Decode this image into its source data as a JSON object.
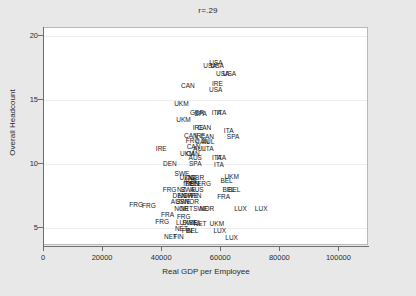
{
  "chart_data": {
    "type": "scatter",
    "title": "r=.29",
    "xlabel": "Real GDP per Employee",
    "ylabel": "Overall Headcount",
    "xlim": [
      0,
      110000
    ],
    "ylim": [
      3.6,
      20.6
    ],
    "xticks": [
      0,
      20000,
      40000,
      60000,
      80000,
      100000
    ],
    "xtick_labels": [
      "0",
      "20000",
      "40000",
      "60000",
      "80000",
      "100000"
    ],
    "yticks": [
      5,
      10,
      15,
      20
    ],
    "ytick_labels": [
      "5",
      "10",
      "15",
      "20"
    ],
    "grid": "horizontal",
    "legend": "none",
    "marker_style": "text-label",
    "points": [
      {
        "label": "USA",
        "x": 58200,
        "y": 17.9
      },
      {
        "label": "USA",
        "x": 56200,
        "y": 17.6
      },
      {
        "label": "USA",
        "x": 58600,
        "y": 17.6
      },
      {
        "label": "USA",
        "x": 60500,
        "y": 17.0
      },
      {
        "label": "USA",
        "x": 62800,
        "y": 17.0
      },
      {
        "label": "CAN",
        "x": 48700,
        "y": 16.1
      },
      {
        "label": "IRE",
        "x": 58700,
        "y": 16.2
      },
      {
        "label": "USA",
        "x": 58100,
        "y": 15.8
      },
      {
        "label": "UKM",
        "x": 46500,
        "y": 14.7
      },
      {
        "label": "GBR",
        "x": 51800,
        "y": 14.0
      },
      {
        "label": "SPA",
        "x": 53000,
        "y": 13.9
      },
      {
        "label": "ITA",
        "x": 58400,
        "y": 14.0
      },
      {
        "label": "ITA",
        "x": 60100,
        "y": 14.0
      },
      {
        "label": "UKM",
        "x": 47200,
        "y": 13.4
      },
      {
        "label": "IRE",
        "x": 52200,
        "y": 12.8
      },
      {
        "label": "CAN",
        "x": 54300,
        "y": 12.8
      },
      {
        "label": "ITA",
        "x": 62500,
        "y": 12.6
      },
      {
        "label": "CAN",
        "x": 49700,
        "y": 12.2
      },
      {
        "label": "IRE",
        "x": 52800,
        "y": 12.2
      },
      {
        "label": "CAN",
        "x": 55200,
        "y": 12.1
      },
      {
        "label": "SPA",
        "x": 64000,
        "y": 12.1
      },
      {
        "label": "FRG",
        "x": 50300,
        "y": 11.8
      },
      {
        "label": "CAN",
        "x": 53500,
        "y": 11.7
      },
      {
        "label": "AUL",
        "x": 55500,
        "y": 11.7
      },
      {
        "label": "CAN",
        "x": 50600,
        "y": 11.3
      },
      {
        "label": "AUL",
        "x": 52600,
        "y": 11.2
      },
      {
        "label": "ITA",
        "x": 55800,
        "y": 11.2
      },
      {
        "label": "IRE",
        "x": 39700,
        "y": 11.2
      },
      {
        "label": "UKM",
        "x": 48500,
        "y": 10.8
      },
      {
        "label": "CAN",
        "x": 50400,
        "y": 10.8
      },
      {
        "label": "AUS",
        "x": 51200,
        "y": 10.5
      },
      {
        "label": "ITA",
        "x": 58500,
        "y": 10.5
      },
      {
        "label": "ITA",
        "x": 60000,
        "y": 10.5
      },
      {
        "label": "DEN",
        "x": 42600,
        "y": 10.0
      },
      {
        "label": "SPA",
        "x": 51200,
        "y": 10.0
      },
      {
        "label": "ITA",
        "x": 59200,
        "y": 9.9
      },
      {
        "label": "SWE",
        "x": 46700,
        "y": 9.2
      },
      {
        "label": "UKM",
        "x": 48300,
        "y": 8.9
      },
      {
        "label": "NZ",
        "x": 50000,
        "y": 8.9
      },
      {
        "label": "GBR",
        "x": 51800,
        "y": 8.9
      },
      {
        "label": "UKM",
        "x": 63500,
        "y": 9.0
      },
      {
        "label": "AUS",
        "x": 49500,
        "y": 8.7
      },
      {
        "label": "BEL",
        "x": 61800,
        "y": 8.7
      },
      {
        "label": "IRE",
        "x": 49000,
        "y": 8.4
      },
      {
        "label": "DEN",
        "x": 50200,
        "y": 8.4
      },
      {
        "label": "BEL",
        "x": 51300,
        "y": 8.4
      },
      {
        "label": "FRG",
        "x": 54200,
        "y": 8.4
      },
      {
        "label": "FRG",
        "x": 42500,
        "y": 8.0
      },
      {
        "label": "NZ",
        "x": 46500,
        "y": 8.0
      },
      {
        "label": "SWE",
        "x": 48800,
        "y": 8.0
      },
      {
        "label": "AUS",
        "x": 51800,
        "y": 8.0
      },
      {
        "label": "BEL",
        "x": 62500,
        "y": 8.0
      },
      {
        "label": "BEL",
        "x": 64400,
        "y": 8.0
      },
      {
        "label": "DEN",
        "x": 45800,
        "y": 7.5
      },
      {
        "label": "NOR",
        "x": 47800,
        "y": 7.5
      },
      {
        "label": "SWE",
        "x": 49600,
        "y": 7.5
      },
      {
        "label": "FIN",
        "x": 51500,
        "y": 7.5
      },
      {
        "label": "FRA",
        "x": 60800,
        "y": 7.4
      },
      {
        "label": "AUS",
        "x": 45200,
        "y": 7.0
      },
      {
        "label": "SWE",
        "x": 47200,
        "y": 7.0
      },
      {
        "label": "NOR",
        "x": 50000,
        "y": 7.0
      },
      {
        "label": "FRG",
        "x": 31200,
        "y": 6.8
      },
      {
        "label": "FRG",
        "x": 35500,
        "y": 6.7
      },
      {
        "label": "NOR",
        "x": 46500,
        "y": 6.5
      },
      {
        "label": "NET",
        "x": 48200,
        "y": 6.5
      },
      {
        "label": "SWE",
        "x": 53000,
        "y": 6.5
      },
      {
        "label": "NOR",
        "x": 55200,
        "y": 6.5
      },
      {
        "label": "LUX",
        "x": 66500,
        "y": 6.5
      },
      {
        "label": "LUX",
        "x": 73500,
        "y": 6.5
      },
      {
        "label": "FRA",
        "x": 41800,
        "y": 6.0
      },
      {
        "label": "FRG",
        "x": 47300,
        "y": 5.9
      },
      {
        "label": "FRG",
        "x": 40000,
        "y": 5.5
      },
      {
        "label": "LUX",
        "x": 46800,
        "y": 5.4
      },
      {
        "label": "SWE",
        "x": 49300,
        "y": 5.4
      },
      {
        "label": "BEL",
        "x": 51200,
        "y": 5.4
      },
      {
        "label": "NET",
        "x": 52800,
        "y": 5.3
      },
      {
        "label": "UKM",
        "x": 58500,
        "y": 5.3
      },
      {
        "label": "NET",
        "x": 46500,
        "y": 4.9
      },
      {
        "label": "FIN",
        "x": 48400,
        "y": 4.8
      },
      {
        "label": "BEL",
        "x": 50200,
        "y": 4.8
      },
      {
        "label": "LUX",
        "x": 59500,
        "y": 4.8
      },
      {
        "label": "NET",
        "x": 42800,
        "y": 4.3
      },
      {
        "label": "FIN",
        "x": 45500,
        "y": 4.3
      },
      {
        "label": "LUX",
        "x": 63500,
        "y": 4.2
      }
    ]
  }
}
